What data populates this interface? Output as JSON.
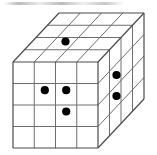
{
  "figure": {
    "title": "",
    "kind": "3d-cube-grid-diagram",
    "background_color": "#ffffff",
    "line_color": "#4a4a4a",
    "inner_line_color": "#6e6e6e",
    "dot_color": "#000000",
    "dot_radius": 4.1,
    "grid": {
      "columns": 4,
      "rows": 4,
      "layers": 4,
      "label": "4 by 4 by 4 cube grid"
    },
    "geometry": {
      "front_left_x": 13,
      "front_top_y": 62,
      "front_width": 85,
      "front_height": 86,
      "depth_dx": 46,
      "depth_dy": -49
    },
    "dots": {
      "count_total": 6,
      "top_face": [
        {
          "name": "top-dot-1",
          "col": 1,
          "depth": 2,
          "x": 65.5,
          "y": 41.5
        }
      ],
      "front_face": [
        {
          "name": "front-dot-1",
          "col": 2,
          "row": 2,
          "x": 44.8,
          "y": 90.2
        },
        {
          "name": "front-dot-2",
          "col": 3,
          "row": 2,
          "x": 66.2,
          "y": 90.2
        },
        {
          "name": "front-dot-3",
          "col": 3,
          "row": 3,
          "x": 66.2,
          "y": 111.5
        }
      ],
      "right_face": [
        {
          "name": "right-dot-1",
          "depth": 1,
          "row": 1,
          "x": 116.5,
          "y": 75.0
        },
        {
          "name": "right-dot-2",
          "depth": 1,
          "row": 2,
          "x": 116.5,
          "y": 96.0
        }
      ]
    },
    "artifacts": {
      "top_smudge": "faint gray scan streak across top edge"
    }
  }
}
